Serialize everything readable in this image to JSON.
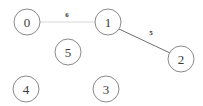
{
  "chart_data": {
    "type": "diagram",
    "title": "",
    "diagram_kind": "undirected weighted graph",
    "nodes": [
      {
        "id": "0",
        "label": "0",
        "cx": 27,
        "cy": 22,
        "r": 13
      },
      {
        "id": "1",
        "label": "1",
        "cx": 108,
        "cy": 22,
        "r": 13
      },
      {
        "id": "2",
        "label": "2",
        "cx": 181,
        "cy": 59,
        "r": 13
      },
      {
        "id": "5",
        "label": "5",
        "cx": 68,
        "cy": 52,
        "r": 13
      },
      {
        "id": "4",
        "label": "4",
        "cx": 26,
        "cy": 89,
        "r": 13
      },
      {
        "id": "3",
        "label": "3",
        "cx": 106,
        "cy": 89,
        "r": 13
      }
    ],
    "edges": [
      {
        "id": "edge-0-1",
        "source": "0",
        "target": "1",
        "weight": "6",
        "x1": 40,
        "y1": 22,
        "x2": 95,
        "y2": 22,
        "label_x": 67,
        "label_y": 15,
        "color": "#d8d8d8",
        "width": 1
      },
      {
        "id": "edge-1-2",
        "source": "1",
        "target": "2",
        "weight": "5",
        "x1": 119,
        "y1": 29,
        "x2": 170,
        "y2": 53,
        "label_x": 151,
        "label_y": 33,
        "color": "#6f6f6f",
        "width": 1
      }
    ],
    "node_count": 6,
    "edge_count": 2,
    "colors": {
      "background": "#ffffff",
      "node_stroke": "#8a8a8a",
      "node_fill": "#ffffff",
      "node_label": "#3b3b3b",
      "edge_label": "#2e2e2e"
    }
  }
}
